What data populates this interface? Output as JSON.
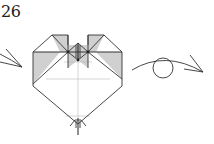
{
  "diagram": {
    "type": "origami-instruction-step",
    "step_number": "26",
    "elements": [
      {
        "name": "step-number",
        "text": "26"
      },
      {
        "name": "valley-fold-arrow-left",
        "description": "curved arrow pointing right into the model from the left"
      },
      {
        "name": "heart-model",
        "description": "heart-shaped folded model with shaded (colored side) flaps at top left and top right, central ridge crease, reference crease lines"
      },
      {
        "name": "turn-over-arrow",
        "description": "curved arrow with loop circle indicating turn the model over"
      }
    ],
    "colors": {
      "line": "#333333",
      "shade": "#d0d0d0",
      "crease": "#bbbbbb",
      "background": "#ffffff"
    }
  }
}
